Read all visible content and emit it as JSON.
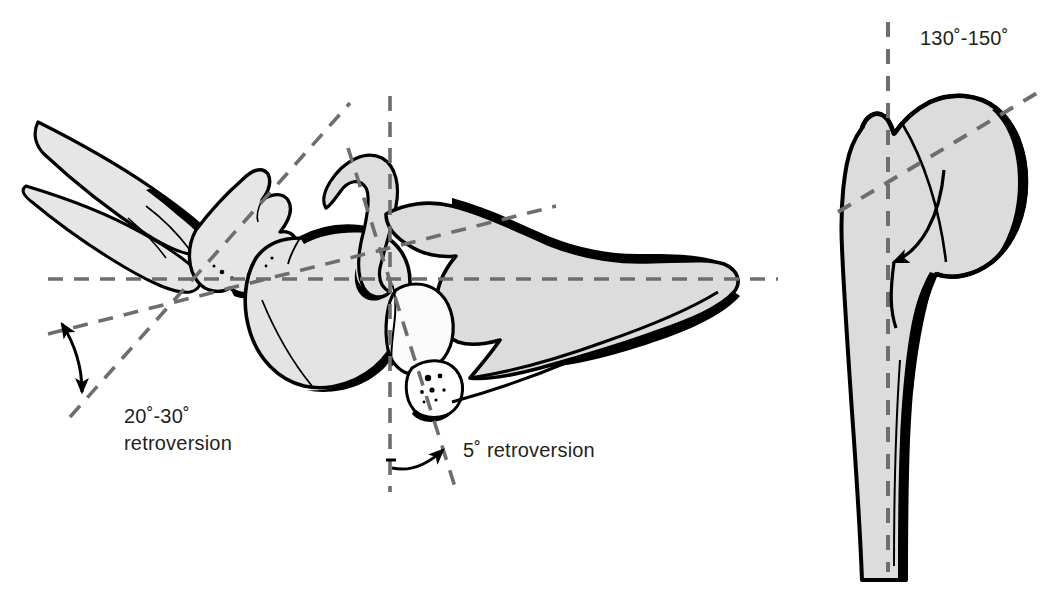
{
  "figure": {
    "background_color": "#ffffff",
    "bone_fill": "#dcdcdc",
    "bone_fill_light": "#eaeaea",
    "outline_color": "#000000",
    "dashed_color": "#6e6e6e",
    "text_color": "#231f20"
  },
  "annotations": {
    "glenoid_version": {
      "value_line": "20˚-30˚",
      "label_line": "retroversion"
    },
    "humeral_head_version": {
      "text": "5˚ retroversion"
    },
    "neck_shaft_angle": {
      "text": "130˚-150˚"
    }
  },
  "panels": [
    {
      "name": "superior-view-scapula-humerus",
      "description": "Superior (axial) view of scapula, clavicle, acromion and humeral head showing glenoid retroversion and humeral head retroversion"
    },
    {
      "name": "anterior-view-proximal-humerus",
      "description": "Anterior view of proximal humerus showing neck-shaft angle"
    }
  ],
  "markers": {
    "glenoid_axis_dashed": "dashed-line",
    "scapular_axis_dashed": "dashed-line",
    "horizontal_reference_dashed": "dashed-line",
    "vertical_reference_dashed": "dashed-line",
    "humeral_head_axis_dashed": "dashed-line",
    "shaft_axis_dashed": "dashed-line",
    "head_axis_dashed": "dashed-line",
    "double_arrow": "double-headed-arrow",
    "curved_arrow_5deg": "curved-arrow",
    "curved_arrow_neck_shaft": "curved-arrow"
  }
}
